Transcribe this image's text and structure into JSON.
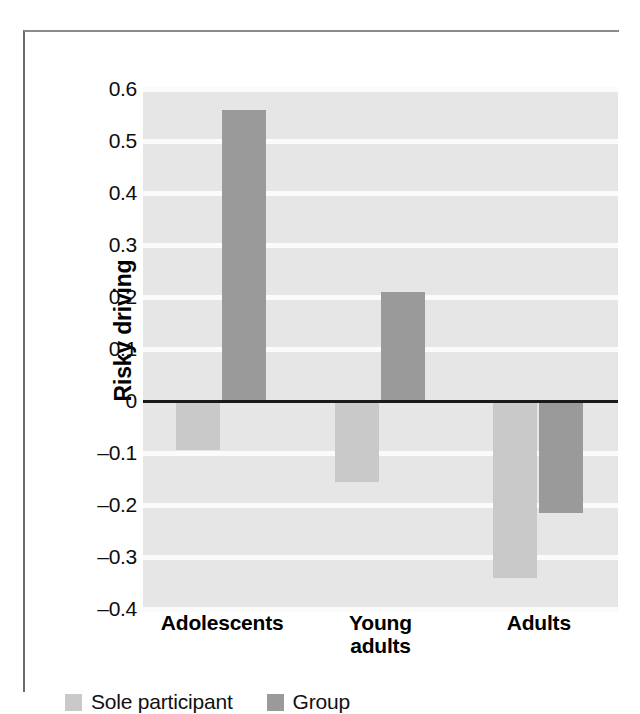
{
  "chart_data": {
    "type": "bar",
    "title": "",
    "xlabel": "",
    "ylabel": "Risky driving",
    "categories": [
      "Adolescents",
      "Young\nadults",
      "Adults"
    ],
    "category_labels": [
      {
        "line1": "Adolescents",
        "line2": ""
      },
      {
        "line1": "Young",
        "line2": "adults"
      },
      {
        "line1": "Adults",
        "line2": ""
      }
    ],
    "series": [
      {
        "name": "Sole participant",
        "color": "#c9c9c9",
        "values": [
          -0.095,
          -0.155,
          -0.34
        ]
      },
      {
        "name": "Group",
        "color": "#9a9a9a",
        "values": [
          0.56,
          0.21,
          -0.215
        ]
      }
    ],
    "ylim": [
      -0.4,
      0.6
    ],
    "ytick_values": [
      0.6,
      0.5,
      0.4,
      0.3,
      0.2,
      0.1,
      0,
      -0.1,
      -0.2,
      -0.3,
      -0.4
    ],
    "ytick_labels": [
      "0.6",
      "0.5",
      "0.4",
      "0.3",
      "0.2",
      "0.1",
      "0",
      "–0.1",
      "–0.2",
      "–0.3",
      "–0.4"
    ],
    "grid": true,
    "grid_color": "#fbfbfb",
    "plot_background": "#e6e6e6",
    "zero_line_color": "#1a1a1a",
    "legend_position": "bottom-left"
  },
  "legend": {
    "items": [
      {
        "label": "Sole participant",
        "color": "#c9c9c9"
      },
      {
        "label": "Group",
        "color": "#9a9a9a"
      }
    ]
  },
  "axis": {
    "y_title": "Risky driving"
  }
}
